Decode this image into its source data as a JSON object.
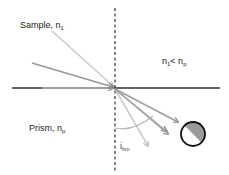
{
  "diagram": {
    "labels": {
      "sample": "Sample, n",
      "sample_sub": "1",
      "condition_n1": "n",
      "condition_sub1": "1",
      "condition_lt": "< n",
      "condition_sub2": "p",
      "prism": "Prism, n",
      "prism_sub": "p",
      "angle": "i",
      "angle_sub": "lim"
    },
    "colors": {
      "interface_line": "#333333",
      "normal_line": "#333333",
      "ray_light": "#c8c8c8",
      "ray_mid": "#a8a8a8",
      "ray_dark": "#8c8c8c",
      "detector_fill": "#9a9a9a",
      "detector_outline": "#111111"
    }
  }
}
